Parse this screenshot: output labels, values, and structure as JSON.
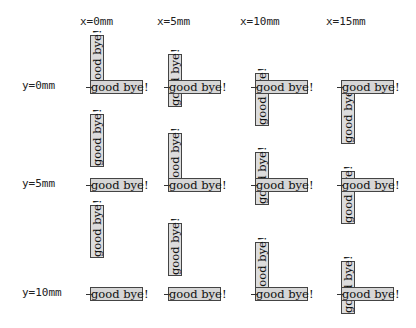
{
  "text": "good bye!",
  "columns": [
    {
      "label": "x=0mm",
      "x_mm": 0
    },
    {
      "label": "x=5mm",
      "x_mm": 5
    },
    {
      "label": "x=10mm",
      "x_mm": 10
    },
    {
      "label": "x=15mm",
      "x_mm": 15
    }
  ],
  "rows": [
    {
      "label": "y=0mm",
      "y_mm": 0
    },
    {
      "label": "y=5mm",
      "y_mm": 5
    },
    {
      "label": "y=10mm",
      "y_mm": 10
    }
  ],
  "colors": {
    "box_fill": "#d6d6d6",
    "box_border": "#444444",
    "tick": "#333333"
  }
}
